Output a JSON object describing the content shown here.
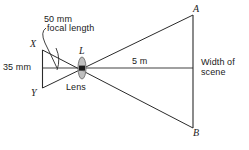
{
  "figure": {
    "type": "optics-lens-ray-diagram",
    "width": 249,
    "height": 150,
    "background_color": "#ffffff",
    "line_color": "#2b2b2b",
    "axis_color": "#777777",
    "lens_color": "#8d8d8d",
    "text_color": "#1a1a1a"
  },
  "labels": {
    "focal_length_value": "50 mm",
    "focal_length_caption": "focal length",
    "film_height": "35 mm",
    "object_distance": "5 m",
    "scene_width_line1": "Width of",
    "scene_width_line2": "scene",
    "lens_caption": "Lens",
    "point_x": "X",
    "point_y": "Y",
    "point_l": "L",
    "point_a": "A",
    "point_b": "B"
  },
  "geometry": {
    "lens_center": {
      "x": 82,
      "y": 68
    },
    "film_top": {
      "x": 42,
      "y": 50
    },
    "film_bottom": {
      "x": 42,
      "y": 88
    },
    "scene_top": {
      "x": 193,
      "y": 15
    },
    "scene_bottom": {
      "x": 193,
      "y": 128
    },
    "axis_start_x": 42,
    "axis_end_x": 193,
    "axis_y": 68,
    "lens_rx": 4,
    "lens_ry": 11
  }
}
